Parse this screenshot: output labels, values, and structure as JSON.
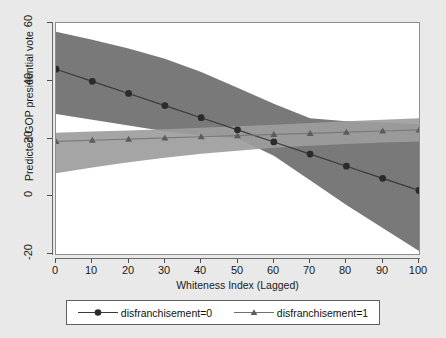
{
  "chart_data": {
    "type": "line",
    "title": "",
    "xlabel": "Whiteness Index (Lagged)",
    "ylabel": "Predicted GOP presidential vote",
    "xlim": [
      0,
      100
    ],
    "ylim": [
      -20,
      60
    ],
    "xticks": [
      "0",
      "10",
      "20",
      "30",
      "40",
      "50",
      "60",
      "70",
      "80",
      "90",
      "100"
    ],
    "yticks": [
      "-20",
      "0",
      "20",
      "40",
      "60"
    ],
    "grid": false,
    "legend_position": "below",
    "x": [
      0,
      10,
      20,
      30,
      40,
      50,
      60,
      70,
      80,
      90,
      100
    ],
    "series": [
      {
        "name": "disfranchisement=0",
        "marker": "circle",
        "color": "#3a3a3a",
        "band_color": "#6e6e6e",
        "values": [
          44,
          39.8,
          35.6,
          31.4,
          27.2,
          23,
          18.8,
          14.6,
          10.4,
          6.2,
          2
        ],
        "ci_upper": [
          57,
          54.2,
          51.2,
          47.6,
          43.0,
          37.6,
          32.0,
          27.0,
          26.0,
          25.5,
          25.0
        ],
        "ci_lower": [
          28.5,
          26.5,
          24.5,
          22.5,
          21.0,
          20.0,
          14.0,
          5.5,
          -3.0,
          -11.0,
          -19.0
        ]
      },
      {
        "name": "disfranchisement=1",
        "marker": "triangle",
        "color": "#7a7a7a",
        "band_color": "#9d9d9d",
        "values": [
          19,
          19.4,
          19.8,
          20.2,
          20.6,
          21,
          21.4,
          21.8,
          22.2,
          22.6,
          23
        ],
        "ci_upper": [
          22.0,
          22.4,
          22.8,
          23.2,
          23.7,
          24.2,
          24.8,
          25.4,
          26.0,
          26.5,
          27.0
        ],
        "ci_lower": [
          8.0,
          10.0,
          11.8,
          13.3,
          14.7,
          15.8,
          16.8,
          17.5,
          18.1,
          18.6,
          19.0
        ]
      }
    ]
  },
  "axis": {
    "y_title": "Predicted GOP presidential vote",
    "x_title": "Whiteness Index (Lagged)"
  },
  "legend": {
    "entries": [
      {
        "label": "disfranchisement=0"
      },
      {
        "label": "disfranchisement=1"
      }
    ]
  }
}
